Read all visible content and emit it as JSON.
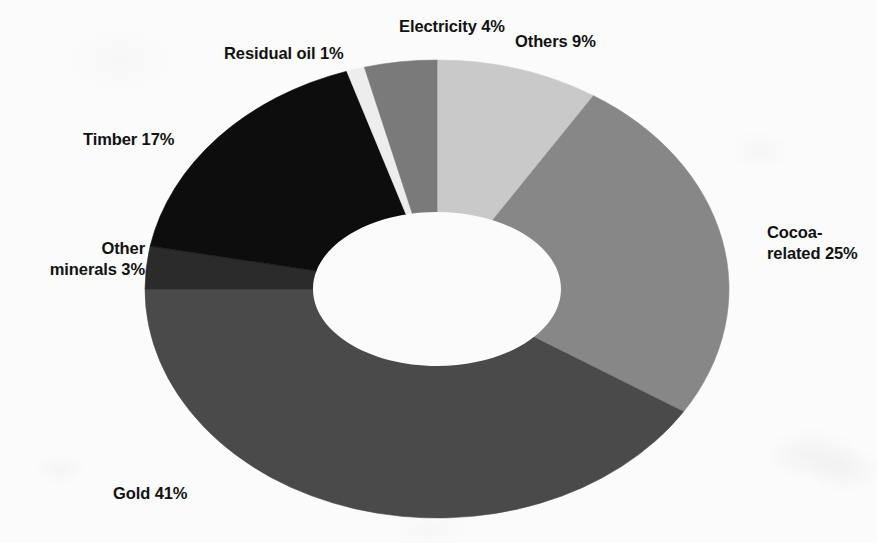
{
  "chart": {
    "title": "",
    "background_color": "#fbfbfb"
  },
  "chart_data": {
    "type": "pie",
    "variant": "donut",
    "title": "",
    "subtitle": "",
    "xlabel": "",
    "ylabel": "",
    "units": "percent",
    "total": 100,
    "legend": "none",
    "labels_position": "outside",
    "start_angle_deg": 0,
    "direction": "clockwise",
    "categories": [
      "Others",
      "Cocoa-related",
      "Gold",
      "Other minerals",
      "Timber",
      "Residual oil",
      "Electricity"
    ],
    "values": [
      9,
      25,
      41,
      3,
      17,
      1,
      4
    ],
    "slices": [
      {
        "label": "Others",
        "label_text": "Others 9%",
        "value": 9,
        "color": "#c9c9c9"
      },
      {
        "label": "Cocoa-related",
        "label_text": "Cocoa-related 25%",
        "value": 25,
        "color": "#878787"
      },
      {
        "label": "Gold",
        "label_text": "Gold 41%",
        "value": 41,
        "color": "#4a4a4a"
      },
      {
        "label": "Other minerals",
        "label_text": "Other minerals 3%",
        "value": 3,
        "color": "#2b2b2b"
      },
      {
        "label": "Timber",
        "label_text": "Timber 17%",
        "value": 17,
        "color": "#0d0d0d"
      },
      {
        "label": "Residual oil",
        "label_text": "Residual oil 1%",
        "value": 1,
        "color": "#ededed"
      },
      {
        "label": "Electricity",
        "label_text": "Electricity 4%",
        "value": 4,
        "color": "#7a7a7a"
      }
    ]
  },
  "labels": {
    "electricity": "Electricity 4%",
    "residual_oil": "Residual oil 1%",
    "others": "Others 9%",
    "cocoa_line1": "Cocoa-",
    "cocoa_line2": "related 25%",
    "timber": "Timber 17%",
    "other_minerals_line1": "Other",
    "other_minerals_line2": "minerals 3%",
    "gold": "Gold 41%"
  }
}
